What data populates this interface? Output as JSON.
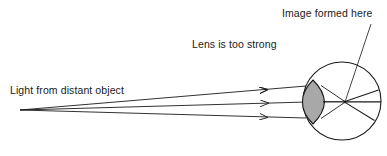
{
  "figure": {
    "type": "optics-ray-diagram",
    "background_color": "#ffffff",
    "stroke_color": "#1a1a1a",
    "lens_fill_color": "#a8a8a8",
    "width": 387,
    "height": 156
  },
  "labels": {
    "image_formed": "Image formed here",
    "lens_too_strong": "Lens is too strong",
    "light_from_object": "Light from distant object"
  },
  "icons": {
    "ray_arrow": "arrowhead-icon",
    "leader_line": "leader-line-icon",
    "eyeball": "eyeball-outline-icon",
    "lens": "lens-shape-icon"
  },
  "geometry": {
    "source_point": {
      "x": 20,
      "y": 110
    },
    "focal_point": {
      "x": 345,
      "y": 102
    },
    "eye_center": {
      "x": 342,
      "y": 101
    },
    "eye_radius": 39,
    "lens": {
      "top": {
        "x": 313,
        "y": 80
      },
      "bottom": {
        "x": 313,
        "y": 124
      },
      "left_bulge_x": 303,
      "right_bulge_x": 325
    },
    "incoming_rays": [
      {
        "from": {
          "x": 20,
          "y": 110
        },
        "to": {
          "x": 306,
          "y": 86
        },
        "arrow_at": {
          "x": 268,
          "y": 89
        }
      },
      {
        "from": {
          "x": 20,
          "y": 110
        },
        "to": {
          "x": 307,
          "y": 102
        },
        "arrow_at": {
          "x": 268,
          "y": 103
        }
      },
      {
        "from": {
          "x": 20,
          "y": 110
        },
        "to": {
          "x": 306,
          "y": 118
        },
        "arrow_at": {
          "x": 268,
          "y": 116
        }
      }
    ],
    "refracted_rays": [
      {
        "from": {
          "x": 321,
          "y": 86
        },
        "to": {
          "x": 345,
          "y": 102
        }
      },
      {
        "from": {
          "x": 322,
          "y": 102
        },
        "to": {
          "x": 345,
          "y": 102
        }
      },
      {
        "from": {
          "x": 321,
          "y": 118
        },
        "to": {
          "x": 345,
          "y": 102
        }
      }
    ],
    "diverging_rays": [
      {
        "from": {
          "x": 345,
          "y": 102
        },
        "to": {
          "x": 378,
          "y": 90
        }
      },
      {
        "from": {
          "x": 345,
          "y": 102
        },
        "to": {
          "x": 381,
          "y": 102
        }
      },
      {
        "from": {
          "x": 345,
          "y": 102
        },
        "to": {
          "x": 375,
          "y": 120
        }
      }
    ],
    "leader": {
      "from": {
        "x": 371,
        "y": 24
      },
      "to": {
        "x": 345,
        "y": 101
      }
    }
  }
}
